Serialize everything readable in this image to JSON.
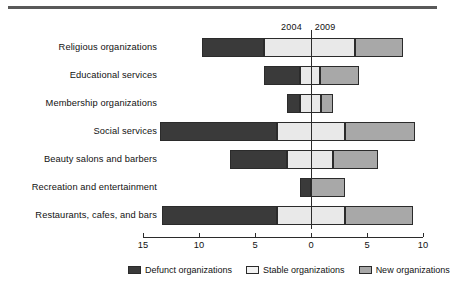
{
  "chart_data": {
    "type": "bar",
    "subtype": "diverging-stacked-horizontal",
    "title": "",
    "xlabel": "",
    "ylabel": "",
    "xlim": [
      -15,
      10
    ],
    "xticks": [
      -15,
      -10,
      -5,
      0,
      5,
      10
    ],
    "xticklabels": [
      "15",
      "10",
      "5",
      "0",
      "5",
      "10"
    ],
    "grid": false,
    "legend_position": "bottom",
    "annotations": [
      {
        "text": "2004",
        "x": -1.6,
        "position": "top"
      },
      {
        "text": "2009",
        "x": 1.4,
        "position": "top"
      }
    ],
    "categories": [
      "Religious organizations",
      "Educational services",
      "Membership organizations",
      "Social services",
      "Beauty salons and barbers",
      "Recreation and entertainment",
      "Restaurants, cafes, and bars"
    ],
    "series": [
      {
        "name": "Defunct organizations",
        "color": "#3a3a3a",
        "values": [
          -9.7,
          -4.2,
          -2.1,
          -13.5,
          -7.2,
          -1.0,
          -13.3
        ]
      },
      {
        "name": "Stable organizations",
        "color": "#e9e9e9",
        "values_left": [
          -4.2,
          -1.0,
          -1.0,
          -3.0,
          -2.1,
          0.0,
          -3.0
        ],
        "values_right": [
          3.9,
          0.8,
          0.9,
          3.0,
          2.0,
          0.0,
          3.0
        ]
      },
      {
        "name": "New organizations",
        "color": "#a8a8a8",
        "values": [
          4.3,
          3.5,
          1.1,
          6.3,
          4.0,
          3.0,
          6.1
        ]
      }
    ],
    "bars": [
      {
        "category": "Religious organizations",
        "defunct_start": -9.7,
        "defunct_end": -4.2,
        "stable_end": 3.9,
        "new_end": 8.2
      },
      {
        "category": "Educational services",
        "defunct_start": -4.2,
        "defunct_end": -1.0,
        "stable_end": 0.8,
        "new_end": 4.3
      },
      {
        "category": "Membership organizations",
        "defunct_start": -2.1,
        "defunct_end": -1.0,
        "stable_end": 0.9,
        "new_end": 2.0
      },
      {
        "category": "Social services",
        "defunct_start": -13.5,
        "defunct_end": -3.0,
        "stable_end": 3.0,
        "new_end": 9.3
      },
      {
        "category": "Beauty salons and barbers",
        "defunct_start": -7.2,
        "defunct_end": -2.1,
        "stable_end": 2.0,
        "new_end": 6.0
      },
      {
        "category": "Recreation and entertainment",
        "defunct_start": -1.0,
        "defunct_end": 0.0,
        "stable_end": 0.0,
        "new_end": 3.0
      },
      {
        "category": "Restaurants, cafes, and bars",
        "defunct_start": -13.3,
        "defunct_end": -3.0,
        "stable_end": 3.0,
        "new_end": 9.1
      }
    ]
  },
  "legend": {
    "items": [
      {
        "label": "Defunct organizations",
        "swatch": "defunct-swatch"
      },
      {
        "label": "Stable organizations",
        "swatch": "stable-swatch"
      },
      {
        "label": "New organizations",
        "swatch": "new-swatch"
      }
    ]
  },
  "axis": {
    "ticklabels": [
      "15",
      "10",
      "5",
      "0",
      "5",
      "10"
    ]
  },
  "year_markers": {
    "left": "2004",
    "right": "2009"
  },
  "categories": [
    "Religious organizations",
    "Educational services",
    "Membership organizations",
    "Social services",
    "Beauty salons and barbers",
    "Recreation and entertainment",
    "Restaurants, cafes, and bars"
  ]
}
